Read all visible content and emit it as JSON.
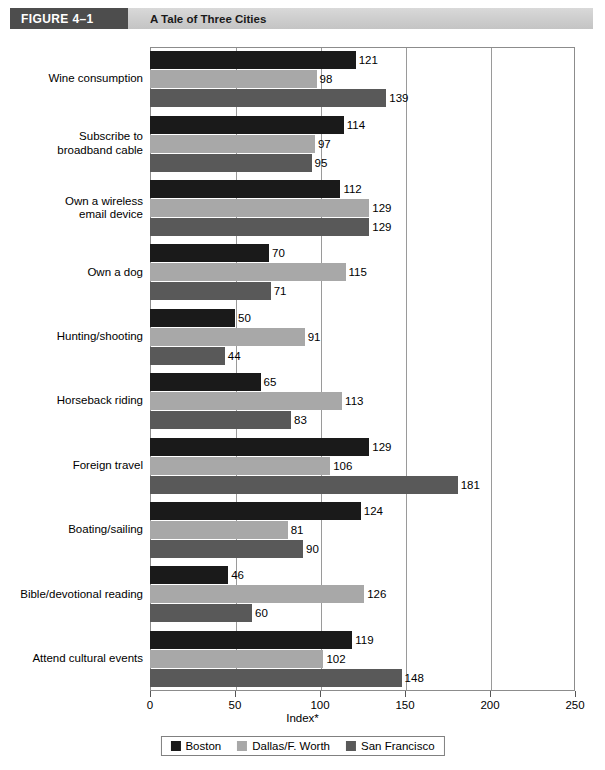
{
  "figure": {
    "tag": "FIGURE  4–1",
    "title": "A Tale of Three Cities"
  },
  "chart_data": {
    "type": "bar",
    "orientation": "horizontal",
    "title": "A Tale of Three Cities",
    "xlabel": "Index*",
    "ylabel": "",
    "xlim": [
      0,
      250
    ],
    "xticks": [
      0,
      50,
      100,
      150,
      200,
      250
    ],
    "xtick_labels": [
      "0",
      "50",
      "100",
      "150",
      "200",
      "250"
    ],
    "grid": true,
    "grid_axis": "x",
    "legend_position": "bottom",
    "categories": [
      "Wine consumption",
      "Subscribe to\nbroadband cable",
      "Own a wireless\nemail device",
      "Own a dog",
      "Hunting/shooting",
      "Horseback riding",
      "Foreign travel",
      "Boating/sailing",
      "Bible/devotional reading",
      "Attend cultural events"
    ],
    "series": [
      {
        "name": "Boston",
        "color": "#1a1a1a",
        "values": [
          121,
          114,
          112,
          70,
          50,
          65,
          129,
          124,
          46,
          119
        ]
      },
      {
        "name": "Dallas/F. Worth",
        "color": "#a8a8a8",
        "values": [
          98,
          97,
          129,
          115,
          91,
          113,
          106,
          81,
          126,
          102
        ]
      },
      {
        "name": "San Francisco",
        "color": "#595959",
        "values": [
          139,
          95,
          129,
          71,
          44,
          83,
          181,
          90,
          60,
          148
        ]
      }
    ]
  },
  "legend": {
    "items": [
      {
        "label": "Boston",
        "color": "#1a1a1a"
      },
      {
        "label": "Dallas/F. Worth",
        "color": "#a8a8a8"
      },
      {
        "label": "San Francisco",
        "color": "#595959"
      }
    ]
  }
}
